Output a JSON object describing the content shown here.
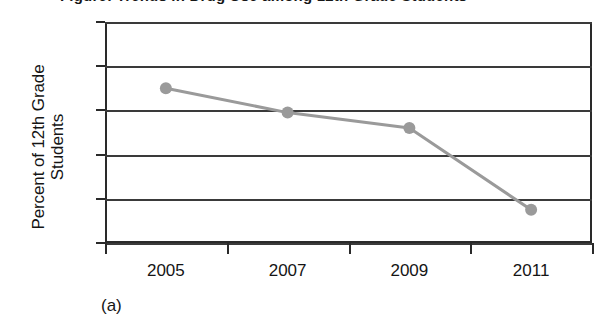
{
  "figure": {
    "title_clipped": "Figure: Trends in Drug Use among 12th Grade Students",
    "subfigure_caption": "(a)",
    "background_color": "#ffffff",
    "axis_color": "#2a2a2a",
    "grid_color": "#3a3a3a",
    "series_color": "#9a9a9a"
  },
  "axes": {
    "ylabel_line1": "Percent of 12th Grade",
    "ylabel_line2": "Students",
    "xlabel": ""
  },
  "chart_data": {
    "type": "line",
    "title": "",
    "xlabel": "",
    "ylabel": "Percent of 12th Grade Students",
    "categories": [
      "2005",
      "2007",
      "2009",
      "2011"
    ],
    "x": [
      2005,
      2007,
      2009,
      2011
    ],
    "values": [
      27.0,
      25.9,
      25.2,
      21.5
    ],
    "series": [
      {
        "name": "Percent of 12th Grade Students",
        "values": [
          27.0,
          25.9,
          25.2,
          21.5
        ],
        "color": "#9a9a9a",
        "marker": "circle",
        "line_width": 3
      }
    ],
    "ylim": [
      20,
      30
    ],
    "yticks": [
      20,
      22,
      24,
      26,
      28,
      30
    ],
    "ytick_labels": [
      "20",
      "22",
      "24",
      "26",
      "28",
      "30"
    ],
    "xtick_labels": [
      "2005",
      "2007",
      "2009",
      "2011"
    ],
    "grid": true,
    "grid_axis": "y",
    "legend": false,
    "legend_position": "none"
  }
}
